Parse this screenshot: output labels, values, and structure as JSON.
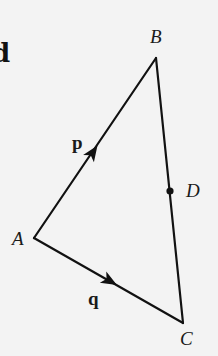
{
  "figure": {
    "type": "triangle-vector-diagram",
    "edge_glyph": "d",
    "colors": {
      "background": "#f3f3f3",
      "line": "#111111"
    },
    "points": [
      {
        "name": "A",
        "label": "A",
        "x": 34,
        "y": 238
      },
      {
        "name": "B",
        "label": "B",
        "x": 156,
        "y": 58
      },
      {
        "name": "C",
        "label": "C",
        "x": 183,
        "y": 323
      },
      {
        "name": "D",
        "label": "D",
        "x": 170,
        "y": 191,
        "on_segment": "BC",
        "marked_dot": true
      }
    ],
    "segments": [
      {
        "from": "A",
        "to": "B",
        "vector_label": "p",
        "arrow": true
      },
      {
        "from": "A",
        "to": "C",
        "vector_label": "q",
        "arrow": true
      },
      {
        "from": "B",
        "to": "C",
        "vector_label": "",
        "arrow": false
      }
    ],
    "vectors": [
      {
        "name": "p",
        "label": "p",
        "along": "AB"
      },
      {
        "name": "q",
        "label": "q",
        "along": "AC"
      }
    ]
  }
}
